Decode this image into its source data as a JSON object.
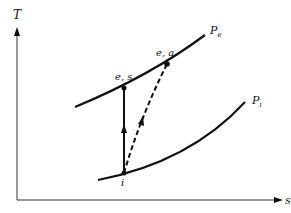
{
  "diagram": {
    "type": "T-s diagram (compressor process)",
    "axes": {
      "y_label": "T",
      "x_label": "s"
    },
    "curves": [
      {
        "id": "pe",
        "label": "P",
        "subscript": "e",
        "description": "exit pressure isobar"
      },
      {
        "id": "pi",
        "label": "P",
        "subscript": "i",
        "description": "inlet pressure isobar"
      }
    ],
    "points": [
      {
        "id": "i",
        "label": "i"
      },
      {
        "id": "es",
        "label": "e, s"
      },
      {
        "id": "ea",
        "label": "e, a"
      }
    ],
    "processes": [
      {
        "from": "i",
        "to": "e, s",
        "style": "solid",
        "description": "isentropic compression"
      },
      {
        "from": "i",
        "to": "e, a",
        "style": "dashed",
        "description": "actual compression"
      }
    ],
    "colors": {
      "line": "#111111",
      "background": "#ffffff"
    }
  }
}
